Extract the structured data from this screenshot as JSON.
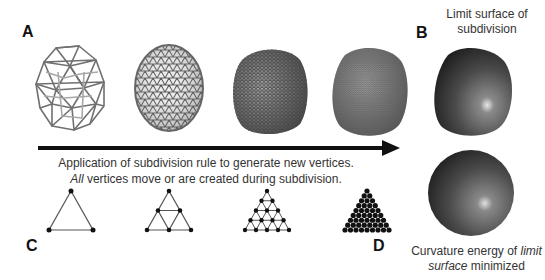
{
  "labels": {
    "a": "A",
    "b": "B",
    "c": "C",
    "d": "D"
  },
  "panel_b": {
    "caption_line1": "Limit surface of",
    "caption_line2": "subdivision"
  },
  "panel_d": {
    "caption_pre": "Curvature energy of ",
    "caption_em1": "limit",
    "caption_em2": "surface",
    "caption_post": " minimized"
  },
  "arrow": {
    "line1": "Application of subdivision rule to generate new vertices.",
    "line2_em": "All",
    "line2_rest": " vertices move or are created during subdivision."
  },
  "meshes": [
    {
      "name": "coarse-wireframe",
      "level": 0
    },
    {
      "name": "level-1-wireframe",
      "level": 1
    },
    {
      "name": "level-2-mesh",
      "level": 2
    },
    {
      "name": "level-3-mesh",
      "level": 3
    }
  ],
  "triangles": [
    {
      "name": "triangle-level-0",
      "rows": 2
    },
    {
      "name": "triangle-level-1",
      "rows": 3
    },
    {
      "name": "triangle-level-2",
      "rows": 5
    },
    {
      "name": "triangle-level-3",
      "rows": 9
    }
  ],
  "colors": {
    "wire": "#6a6a6a",
    "surface_dark": "#2a2a2a",
    "surface_light": "#bdbdbd",
    "arrow": "#111111"
  }
}
